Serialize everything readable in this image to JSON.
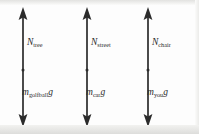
{
  "figure": {
    "type": "free-body-diagram-set",
    "background_color": "#fdfdfd",
    "arrow_color": "#2b2b2b",
    "text_color": "#2b2b2b"
  },
  "diagrams": [
    {
      "id": "golfball-on-tree",
      "normal_force": {
        "symbol": "N",
        "subscript": "tree",
        "direction": "up",
        "full_label": "N_tree"
      },
      "weight_force": {
        "symbol": "m",
        "subscript": "golfball",
        "trailing": "g",
        "direction": "down",
        "full_label": "m_golfball g"
      }
    },
    {
      "id": "car-on-street",
      "normal_force": {
        "symbol": "N",
        "subscript": "street",
        "direction": "up",
        "full_label": "N_street"
      },
      "weight_force": {
        "symbol": "m",
        "subscript": "car",
        "trailing": "g",
        "direction": "down",
        "full_label": "m_car g"
      }
    },
    {
      "id": "you-on-chair",
      "normal_force": {
        "symbol": "N",
        "subscript": "chair",
        "direction": "up",
        "full_label": "N_chair"
      },
      "weight_force": {
        "symbol": "m",
        "subscript": "you",
        "trailing": "g",
        "direction": "down",
        "full_label": "m_you g"
      }
    }
  ]
}
